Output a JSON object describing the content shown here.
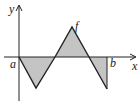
{
  "diagram": {
    "labels": {
      "y_axis": "y",
      "x_axis": "x",
      "function": "f",
      "lower_bound": "a",
      "upper_bound": "b"
    },
    "colors": {
      "fill": "#c4c4c4",
      "stroke": "#222222",
      "background": "#ffffff"
    },
    "curve_points": "19,57 36,88 55,57 72,27 89,57 107,89",
    "regions": [
      {
        "name": "below-1",
        "points": "19,57 36,88 55,57"
      },
      {
        "name": "above-1",
        "points": "55,57 72,27 89,57"
      },
      {
        "name": "below-2",
        "points": "89,57 107,89 107,57"
      }
    ]
  }
}
